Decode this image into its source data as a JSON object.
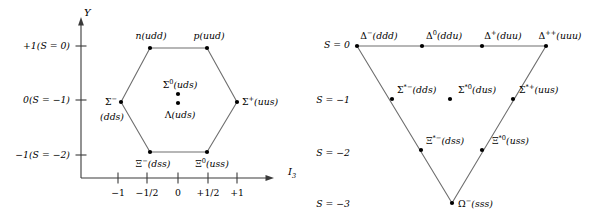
{
  "figure": {
    "line_color": "#3a3a3a",
    "dot_color": "#000000",
    "text_color": "#000000",
    "background": "#ffffff"
  },
  "octet": {
    "axis": {
      "y_label": "Y",
      "x_label": "I",
      "x_label_sub": "3",
      "y_ticks": [
        {
          "text": "+1(S = 0)",
          "value": 1,
          "strangeness": 0
        },
        {
          "text": "0(S = −1)",
          "value": 0,
          "strangeness": -1
        },
        {
          "text": "−1(S = −2)",
          "value": -1,
          "strangeness": -2
        }
      ],
      "x_ticks": [
        {
          "text": "−1",
          "value": -1
        },
        {
          "text": "−1/2",
          "value": -0.5
        },
        {
          "text": "0",
          "value": 0
        },
        {
          "text": "+1/2",
          "value": 0.5
        },
        {
          "text": "+1",
          "value": 1
        }
      ]
    },
    "particles": [
      {
        "symbol": "n",
        "sup": "",
        "quarks": "(udd)",
        "i3": -0.5,
        "y": 1,
        "label_pos": "above"
      },
      {
        "symbol": "p",
        "sup": "",
        "quarks": "(uud)",
        "i3": 0.5,
        "y": 1,
        "label_pos": "above"
      },
      {
        "symbol": "Σ",
        "sup": "−",
        "quarks": "(dds)",
        "i3": -1,
        "y": 0,
        "label_pos": "left-split"
      },
      {
        "symbol": "Σ",
        "sup": "0",
        "quarks": "(uds)",
        "i3": 0,
        "y": 0,
        "label_pos": "above-center"
      },
      {
        "symbol": "Λ",
        "sup": "",
        "quarks": "(uds)",
        "i3": 0,
        "y": 0,
        "label_pos": "below-center"
      },
      {
        "symbol": "Σ",
        "sup": "+",
        "quarks": "(uus)",
        "i3": 1,
        "y": 0,
        "label_pos": "right"
      },
      {
        "symbol": "Ξ",
        "sup": "−",
        "quarks": "(dss)",
        "i3": -0.5,
        "y": -1,
        "label_pos": "below"
      },
      {
        "symbol": "Ξ",
        "sup": "0",
        "quarks": "(uss)",
        "i3": 0.5,
        "y": -1,
        "label_pos": "below"
      }
    ]
  },
  "decuplet": {
    "axis": {
      "s_labels": [
        {
          "text": "S = 0",
          "value": 0
        },
        {
          "text": "S = −1",
          "value": -1
        },
        {
          "text": "S = −2",
          "value": -2
        },
        {
          "text": "S = −3",
          "value": -3
        }
      ]
    },
    "particles": [
      {
        "symbol": "Δ",
        "sup": "−",
        "quarks": "(ddd)",
        "i3": -1.5,
        "s": 0
      },
      {
        "symbol": "Δ",
        "sup": "0",
        "quarks": "(ddu)",
        "i3": -0.5,
        "s": 0
      },
      {
        "symbol": "Δ",
        "sup": "+",
        "quarks": "(duu)",
        "i3": 0.5,
        "s": 0
      },
      {
        "symbol": "Δ",
        "sup": "++",
        "quarks": "(uuu)",
        "i3": 1.5,
        "s": 0
      },
      {
        "symbol": "Σ",
        "sup": "*−",
        "quarks": "(dds)",
        "i3": -1,
        "s": -1
      },
      {
        "symbol": "Σ",
        "sup": "*0",
        "quarks": "(dus)",
        "i3": 0,
        "s": -1
      },
      {
        "symbol": "Σ",
        "sup": "*+",
        "quarks": "(uus)",
        "i3": 1,
        "s": -1
      },
      {
        "symbol": "Ξ",
        "sup": "*−",
        "quarks": "(dss)",
        "i3": -0.5,
        "s": -2
      },
      {
        "symbol": "Ξ",
        "sup": "*0",
        "quarks": "(uss)",
        "i3": 0.5,
        "s": -2
      },
      {
        "symbol": "Ω",
        "sup": "−",
        "quarks": "(sss)",
        "i3": 0,
        "s": -3
      }
    ]
  }
}
